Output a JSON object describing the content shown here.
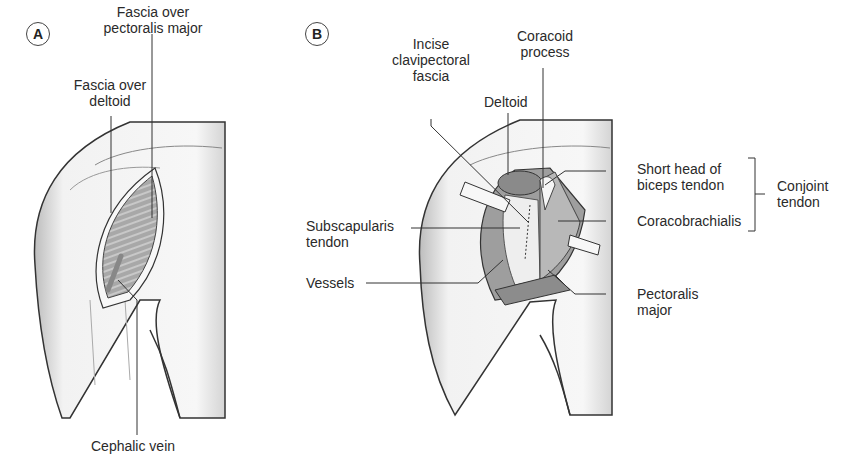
{
  "panels": {
    "A": {
      "badge": "A",
      "labels": {
        "fascia_pectoralis": [
          "Fascia over",
          "pectoralis major"
        ],
        "fascia_deltoid": [
          "Fascia over",
          "deltoid"
        ],
        "cephalic_vein": "Cephalic vein"
      }
    },
    "B": {
      "badge": "B",
      "labels": {
        "incise": [
          "Incise",
          "clavipectoral",
          "fascia"
        ],
        "coracoid": [
          "Coracoid",
          "process"
        ],
        "deltoid": "Deltoid",
        "short_head": [
          "Short head of",
          "biceps tendon"
        ],
        "coracobrachialis": "Coracobrachialis",
        "conjoint": [
          "Conjoint",
          "tendon"
        ],
        "subscapularis": [
          "Subscapularis",
          "tendon"
        ],
        "vessels": "Vessels",
        "pectoralis": [
          "Pectoralis",
          "major"
        ]
      }
    }
  },
  "colors": {
    "line": "#333333",
    "skin": "#f4f4f4",
    "skin_shade": "#d8d8d8",
    "muscle": "#9a9a9a",
    "muscle_dark": "#7a7a7a",
    "tendon": "#e6e6e6"
  }
}
